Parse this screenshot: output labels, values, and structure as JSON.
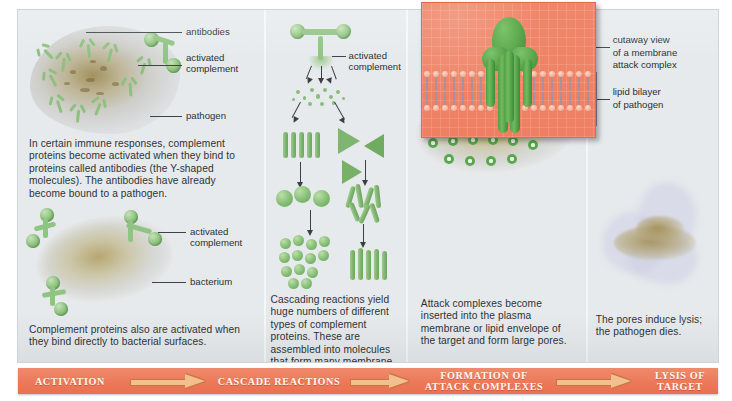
{
  "figure": {
    "background_color": "#ffffff",
    "panel_color": "#e6eaec",
    "banner_color": "#ec7757",
    "protein_color": "#8cc17e",
    "membrane_color": "#f0876a"
  },
  "panels": [
    {
      "id": "activation",
      "labels": [
        {
          "name": "antibodies",
          "text": "antibodies"
        },
        {
          "name": "activated-complement",
          "text": "activated\ncomplement",
          "line1": "activated",
          "line2": "complement"
        },
        {
          "name": "pathogen",
          "text": "pathogen"
        },
        {
          "name": "activated-complement-2",
          "line1": "activated",
          "line2": "complement"
        },
        {
          "name": "bacterium",
          "text": "bacterium"
        }
      ],
      "caption_top": "In certain immune responses, complement proteins become activated when they bind to proteins called antibodies (the Y-shaped molecules). The antibodies have already become bound to a pathogen.",
      "caption_bottom": "Complement proteins also are activated when they bind directly to bacterial surfaces."
    },
    {
      "id": "cascade",
      "labels": [
        {
          "name": "activated-complement",
          "line1": "activated",
          "line2": "complement"
        }
      ],
      "caption": "Cascading reactions yield huge numbers of different types of complement proteins. These are assembled into molecules that form many membrane attack complexes."
    },
    {
      "id": "attack-complex-formation",
      "caption": "Attack complexes become inserted into the plasma membrane or lipid envelope of the target and form large pores."
    },
    {
      "id": "lysis",
      "labels": [
        {
          "name": "cutaway-view",
          "line1": "cutaway view",
          "line2": "of a membrane",
          "line3": "attack complex"
        },
        {
          "name": "lipid-bilayer",
          "line1": "lipid bilayer",
          "line2": "of pathogen"
        }
      ],
      "caption": "The pores induce lysis; the pathogen dies."
    }
  ],
  "banner": {
    "steps": [
      {
        "name": "activation",
        "label": "ACTIVATION",
        "line1": "ACTIVATION",
        "line2": ""
      },
      {
        "name": "cascade-reactions",
        "label": "CASCADE REACTIONS",
        "line1": "CASCADE REACTIONS",
        "line2": ""
      },
      {
        "name": "formation-of-attack-complexes",
        "label": "FORMATION OF ATTACK COMPLEXES",
        "line1": "FORMATION OF",
        "line2": "ATTACK COMPLEXES"
      },
      {
        "name": "lysis-of-target",
        "label": "LYSIS OF TARGET",
        "line1": "LYSIS OF",
        "line2": "TARGET"
      }
    ],
    "arrow_glyph": "arrow-right"
  }
}
